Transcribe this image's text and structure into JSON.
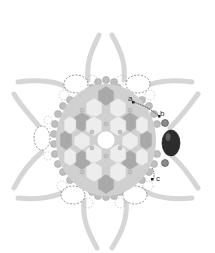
{
  "diagram": {
    "type": "beadwork-pattern",
    "labels": [
      {
        "id": "a",
        "text": "a"
      },
      {
        "id": "b",
        "text": "b"
      },
      {
        "id": "c",
        "text": "c"
      }
    ],
    "colors": {
      "arm": "#d4d4d4",
      "hex_dark": "#a8a8a8",
      "hex_light": "#ececec",
      "seed_bead": "#bdbdbd",
      "focal_bead": "#2b2b2b",
      "dashed_outline": "#777777",
      "thread": "#333333"
    }
  }
}
